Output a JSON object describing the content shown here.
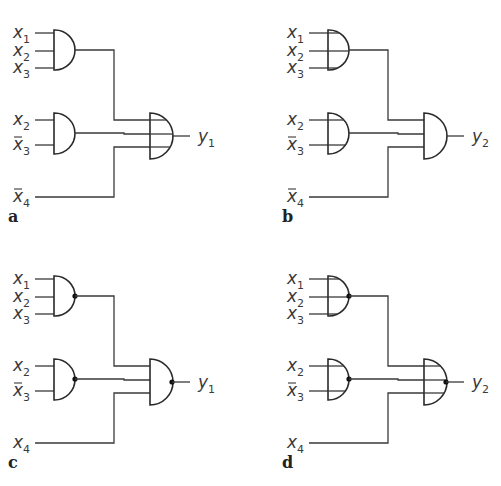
{
  "figure": {
    "colors": {
      "line": "#3a3a3a",
      "gate": "#2a2a2a",
      "background": "#ffffff"
    }
  },
  "panels": [
    {
      "id": "a",
      "label": "a",
      "output": {
        "name": "y",
        "sub": "1"
      },
      "first_level_type": "AND",
      "second_level_type": "OR",
      "gate1_inputs": [
        {
          "name": "x",
          "sub": "1",
          "negated": false
        },
        {
          "name": "x",
          "sub": "2",
          "negated": false
        },
        {
          "name": "x",
          "sub": "3",
          "negated": false
        }
      ],
      "gate2_inputs": [
        {
          "name": "x",
          "sub": "2",
          "negated": false
        },
        {
          "name": "x",
          "sub": "3",
          "negated": true
        }
      ],
      "direct_input": {
        "name": "x",
        "sub": "4",
        "negated": true
      }
    },
    {
      "id": "b",
      "label": "b",
      "output": {
        "name": "y",
        "sub": "2"
      },
      "first_level_type": "OR",
      "second_level_type": "AND",
      "gate1_inputs": [
        {
          "name": "x",
          "sub": "1",
          "negated": false
        },
        {
          "name": "x",
          "sub": "2",
          "negated": false
        },
        {
          "name": "x",
          "sub": "3",
          "negated": false
        }
      ],
      "gate2_inputs": [
        {
          "name": "x",
          "sub": "2",
          "negated": false
        },
        {
          "name": "x",
          "sub": "3",
          "negated": true
        }
      ],
      "direct_input": {
        "name": "x",
        "sub": "4",
        "negated": true
      }
    },
    {
      "id": "c",
      "label": "c",
      "output": {
        "name": "y",
        "sub": "1"
      },
      "first_level_type": "NAND",
      "second_level_type": "NAND",
      "gate1_inputs": [
        {
          "name": "x",
          "sub": "1",
          "negated": false
        },
        {
          "name": "x",
          "sub": "2",
          "negated": false
        },
        {
          "name": "x",
          "sub": "3",
          "negated": false
        }
      ],
      "gate2_inputs": [
        {
          "name": "x",
          "sub": "2",
          "negated": false
        },
        {
          "name": "x",
          "sub": "3",
          "negated": true
        }
      ],
      "direct_input": {
        "name": "x",
        "sub": "4",
        "negated": false
      }
    },
    {
      "id": "d",
      "label": "d",
      "output": {
        "name": "y",
        "sub": "2"
      },
      "first_level_type": "NOR",
      "second_level_type": "NOR",
      "gate1_inputs": [
        {
          "name": "x",
          "sub": "1",
          "negated": false
        },
        {
          "name": "x",
          "sub": "2",
          "negated": false
        },
        {
          "name": "x",
          "sub": "3",
          "negated": false
        }
      ],
      "gate2_inputs": [
        {
          "name": "x",
          "sub": "2",
          "negated": false
        },
        {
          "name": "x",
          "sub": "3",
          "negated": true
        }
      ],
      "direct_input": {
        "name": "x",
        "sub": "4",
        "negated": false
      }
    }
  ],
  "notation": {
    "and_symbol": "half-circle gate",
    "or_symbol": "half-circle gate with input lines drawn through body",
    "negation_symbol": "filled dot at gate output"
  }
}
